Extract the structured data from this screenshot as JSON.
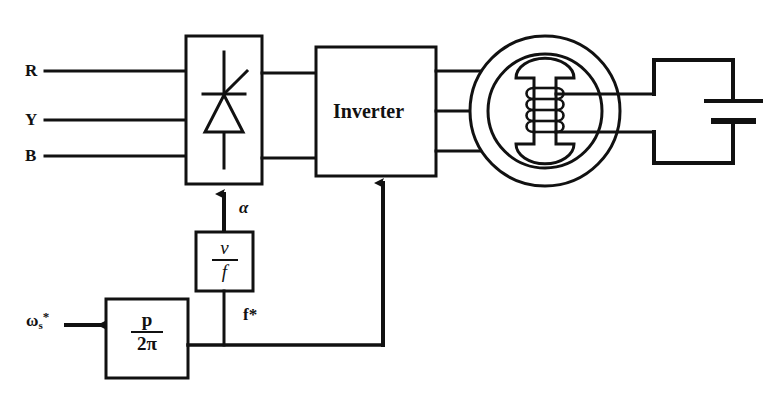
{
  "diagram": {
    "stroke_color": "#111111",
    "background": "#ffffff",
    "width": 767,
    "height": 406
  },
  "inputs": {
    "phase_r": "R",
    "phase_y": "Y",
    "phase_b": "B",
    "speed_reference": {
      "base": "ω",
      "subscript": "s",
      "superscript": "*"
    }
  },
  "blocks": {
    "rectifier": {
      "name": "rectifier",
      "label": "",
      "symbol": "thyristor-scr"
    },
    "inverter": {
      "name": "inverter",
      "label": "Inverter"
    },
    "vf_controller": {
      "name": "v-over-f",
      "numerator": "v",
      "denominator": "f"
    },
    "pole_pair": {
      "name": "p-over-2pi",
      "numerator": "p",
      "denominator": "2π"
    },
    "motor": {
      "name": "synchronous-motor",
      "symbol": "motor-with-field-winding"
    },
    "dc_source": {
      "name": "dc-field-supply",
      "symbol": "battery"
    }
  },
  "signals": {
    "firing_angle": "α",
    "frequency_reference": "f*"
  }
}
